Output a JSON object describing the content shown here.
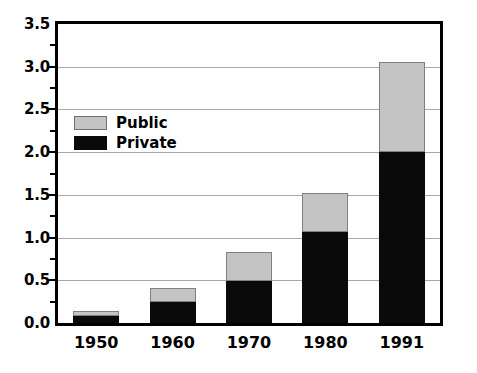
{
  "chart_data": {
    "type": "bar",
    "title": "",
    "subtitle": "",
    "xlabel": "",
    "ylabel": "",
    "stacked": true,
    "orientation": "vertical",
    "categories": [
      "1950",
      "1960",
      "1970",
      "1980",
      "1991"
    ],
    "series": [
      {
        "name": "Private",
        "color": "#0a0a0a",
        "values": [
          0.08,
          0.25,
          0.49,
          1.07,
          2.0
        ]
      },
      {
        "name": "Public",
        "color": "#c4c4c4",
        "values": [
          0.06,
          0.16,
          0.34,
          0.45,
          1.06
        ]
      }
    ],
    "totals": [
      0.14,
      0.41,
      0.83,
      1.52,
      3.06
    ],
    "ylim": [
      0.0,
      3.5
    ],
    "ytick_labels": [
      "0.0",
      "0.5",
      "1.0",
      "1.5",
      "2.0",
      "2.5",
      "3.0",
      "3.5"
    ],
    "ytick_values": [
      0.0,
      0.5,
      1.0,
      1.5,
      2.0,
      2.5,
      3.0,
      3.5
    ],
    "yminor_values": [
      0.25,
      0.75,
      1.25,
      1.75,
      2.25,
      2.75,
      3.25
    ],
    "grid": true,
    "grid_axis": "y",
    "legend_position": "top-left-inside",
    "legend_entries": [
      {
        "label": "Public",
        "color": "#c4c4c4",
        "swatch": "gray-square"
      },
      {
        "label": "Private",
        "color": "#0a0a0a",
        "swatch": "black-square"
      }
    ],
    "colors": {
      "public": "#c4c4c4",
      "private": "#0a0a0a",
      "gridline": "#a8a8a8",
      "frame": "#000000",
      "background": "#ffffff"
    }
  }
}
